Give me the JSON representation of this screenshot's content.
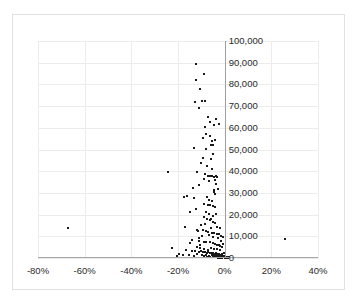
{
  "chart_data": {
    "type": "scatter",
    "title": "",
    "xlabel": "",
    "ylabel": "",
    "xlim": [
      -80,
      40
    ],
    "ylim": [
      0,
      100000
    ],
    "grid": true,
    "legend": null,
    "x_tick_labels": [
      "-80%",
      "-60%",
      "-40%",
      "-20%",
      "0%",
      "20%",
      "40%"
    ],
    "x_tick_values": [
      -80,
      -60,
      -40,
      -20,
      0,
      20,
      40
    ],
    "y_tick_labels": [
      "0",
      "10,000",
      "20,000",
      "30,000",
      "40,000",
      "50,000",
      "60,000",
      "70,000",
      "80,000",
      "90,000",
      "100,000"
    ],
    "y_tick_values": [
      0,
      10000,
      20000,
      30000,
      40000,
      50000,
      60000,
      70000,
      80000,
      90000,
      100000
    ],
    "marker_color": "#1a1a1a",
    "grid_color": "#ececed",
    "axis_color": "#a0a0a0",
    "frame_color": "#e2e2e2",
    "points": [
      [
        -12.5,
        89500
      ],
      [
        -9.0,
        85000
      ],
      [
        -12.2,
        82200
      ],
      [
        -10.5,
        78000
      ],
      [
        -12.8,
        71800
      ],
      [
        -9.6,
        72300
      ],
      [
        -8.6,
        72300
      ],
      [
        -11.0,
        69000
      ],
      [
        -7.3,
        64800
      ],
      [
        -3.7,
        64000
      ],
      [
        -8.3,
        60500
      ],
      [
        -7.9,
        57000
      ],
      [
        -9.5,
        55200
      ],
      [
        -6.3,
        56200
      ],
      [
        -5.6,
        54000
      ],
      [
        -4.0,
        54500
      ],
      [
        -6.0,
        52000
      ],
      [
        -5.2,
        52200
      ],
      [
        -13.0,
        50700
      ],
      [
        -10.0,
        44000
      ],
      [
        -7.6,
        42200
      ],
      [
        -5.3,
        41000
      ],
      [
        -11.8,
        39600
      ],
      [
        -24.5,
        39700
      ],
      [
        -8.5,
        38600
      ],
      [
        -7.0,
        37700
      ],
      [
        -6.3,
        37900
      ],
      [
        -5.4,
        37600
      ],
      [
        -4.6,
        37400
      ],
      [
        -3.9,
        37900
      ],
      [
        -3.3,
        37300
      ],
      [
        -8.8,
        36200
      ],
      [
        -6.6,
        35500
      ],
      [
        -4.1,
        35900
      ],
      [
        -3.6,
        34000
      ],
      [
        -13.5,
        32400
      ],
      [
        -4.5,
        31500
      ],
      [
        -4.4,
        30400
      ],
      [
        -4.3,
        29300
      ],
      [
        -17.5,
        28000
      ],
      [
        -16.2,
        28800
      ],
      [
        -3.0,
        31800
      ],
      [
        -7.5,
        28100
      ],
      [
        -13.0,
        27800
      ],
      [
        -6.6,
        26800
      ],
      [
        -5.4,
        26100
      ],
      [
        -8.7,
        24900
      ],
      [
        -7.2,
        24200
      ],
      [
        -6.1,
        24400
      ],
      [
        -5.1,
        23800
      ],
      [
        -4.0,
        23500
      ],
      [
        -15.0,
        21000
      ],
      [
        -8.0,
        21300
      ],
      [
        -6.8,
        20200
      ],
      [
        -9.0,
        18800
      ],
      [
        -7.6,
        18100
      ],
      [
        -6.4,
        17400
      ],
      [
        -5.8,
        17900
      ],
      [
        -5.0,
        16600
      ],
      [
        -4.2,
        16200
      ],
      [
        -10.2,
        15100
      ],
      [
        -17.0,
        14200
      ],
      [
        -67.0,
        13900
      ],
      [
        -12.0,
        13000
      ],
      [
        -11.5,
        12600
      ],
      [
        -9.4,
        12900
      ],
      [
        -8.2,
        12300
      ],
      [
        -7.0,
        12000
      ],
      [
        -5.5,
        11600
      ],
      [
        -4.6,
        11400
      ],
      [
        -3.2,
        11200
      ],
      [
        -2.4,
        10900
      ],
      [
        -1.6,
        10200
      ],
      [
        -0.8,
        9600
      ],
      [
        26.0,
        8900
      ],
      [
        -13.8,
        8400
      ],
      [
        -11.0,
        8000
      ],
      [
        -9.0,
        7600
      ],
      [
        -7.8,
        7200
      ],
      [
        -6.5,
        7400
      ],
      [
        -5.2,
        6900
      ],
      [
        -22.5,
        4400
      ],
      [
        -4.1,
        6600
      ],
      [
        -3.2,
        6200
      ],
      [
        -2.5,
        5900
      ],
      [
        -1.8,
        5500
      ],
      [
        -1.0,
        5200
      ],
      [
        -16.5,
        3600
      ],
      [
        -14.2,
        3000
      ],
      [
        -12.6,
        3400
      ],
      [
        -11.0,
        2800
      ],
      [
        -10.0,
        3100
      ],
      [
        -9.2,
        2600
      ],
      [
        -8.4,
        2900
      ],
      [
        -7.7,
        2400
      ],
      [
        -7.0,
        2700
      ],
      [
        -6.4,
        2200
      ],
      [
        -5.8,
        2500
      ],
      [
        -5.2,
        2000
      ],
      [
        -4.8,
        2300
      ],
      [
        -4.3,
        1900
      ],
      [
        -3.9,
        2100
      ],
      [
        -3.5,
        1700
      ],
      [
        -3.1,
        1900
      ],
      [
        -2.8,
        1500
      ],
      [
        -2.5,
        1700
      ],
      [
        -2.2,
        1300
      ],
      [
        -1.9,
        1500
      ],
      [
        -1.7,
        1100
      ],
      [
        -1.5,
        1300
      ],
      [
        -1.3,
        900
      ],
      [
        -1.1,
        1100
      ],
      [
        -0.9,
        700
      ],
      [
        -0.8,
        900
      ],
      [
        -0.7,
        600
      ],
      [
        -0.6,
        800
      ],
      [
        -0.5,
        500
      ],
      [
        -0.45,
        700
      ],
      [
        -0.4,
        400
      ],
      [
        -0.35,
        600
      ],
      [
        -0.3,
        350
      ],
      [
        -0.25,
        500
      ],
      [
        -0.2,
        300
      ],
      [
        -0.15,
        450
      ],
      [
        -0.1,
        250
      ],
      [
        -0.05,
        400
      ],
      [
        0.0,
        200
      ],
      [
        0.3,
        350
      ],
      [
        0.6,
        180
      ],
      [
        1.0,
        300
      ],
      [
        1.4,
        150
      ],
      [
        1.8,
        250
      ],
      [
        -9.8,
        1200
      ],
      [
        -8.8,
        800
      ],
      [
        -8.0,
        1400
      ],
      [
        -7.4,
        600
      ],
      [
        -6.8,
        1000
      ],
      [
        -6.2,
        500
      ],
      [
        -5.6,
        1200
      ],
      [
        -5.0,
        400
      ],
      [
        -4.5,
        900
      ],
      [
        -4.0,
        300
      ],
      [
        -3.6,
        800
      ],
      [
        -3.3,
        250
      ],
      [
        -3.0,
        700
      ],
      [
        -2.7,
        200
      ],
      [
        -2.4,
        600
      ],
      [
        -2.1,
        150
      ],
      [
        -1.85,
        550
      ],
      [
        -1.6,
        120
      ],
      [
        -1.4,
        480
      ],
      [
        -1.2,
        100
      ],
      [
        -1.05,
        420
      ],
      [
        -0.95,
        90
      ],
      [
        -12.0,
        5000
      ],
      [
        -10.6,
        4600
      ],
      [
        -19.5,
        1800
      ],
      [
        -18.0,
        1200
      ],
      [
        -15.5,
        1600
      ],
      [
        -13.2,
        1000
      ],
      [
        -11.8,
        1900
      ],
      [
        -20.5,
        800
      ],
      [
        -2.0,
        13800
      ],
      [
        -3.5,
        14500
      ],
      [
        -6.0,
        14000
      ],
      [
        -8.5,
        15800
      ],
      [
        -5.0,
        19500
      ],
      [
        -3.8,
        20500
      ],
      [
        -2.8,
        9200
      ],
      [
        -4.8,
        9800
      ],
      [
        -6.8,
        10400
      ],
      [
        -9.8,
        10100
      ],
      [
        -11.2,
        9400
      ],
      [
        -2.2,
        3800
      ],
      [
        -3.4,
        4200
      ],
      [
        -4.6,
        4000
      ],
      [
        -5.9,
        4400
      ],
      [
        -7.2,
        3900
      ],
      [
        -8.9,
        4100
      ],
      [
        -10.5,
        6100
      ],
      [
        -1.5,
        7800
      ],
      [
        -0.6,
        6400
      ],
      [
        -0.4,
        2200
      ],
      [
        -1.0,
        1800
      ],
      [
        -14.8,
        6800
      ],
      [
        -12.4,
        22500
      ],
      [
        -10.8,
        33500
      ],
      [
        -9.2,
        46000
      ],
      [
        -4.9,
        48000
      ],
      [
        -5.8,
        45500
      ],
      [
        -7.8,
        50200
      ],
      [
        -6.2,
        62500
      ],
      [
        -4.4,
        61500
      ],
      [
        -2.6,
        61800
      ]
    ]
  }
}
